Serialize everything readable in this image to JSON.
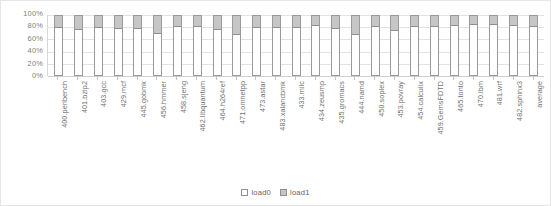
{
  "chart_data": {
    "type": "bar",
    "subtype": "stacked-percentage",
    "title": "",
    "xlabel": "",
    "ylabel": "",
    "ylim": [
      0,
      100
    ],
    "yticks": [
      0,
      20,
      40,
      60,
      80,
      100
    ],
    "ytick_labels": [
      "0%",
      "20%",
      "40%",
      "60%",
      "80%",
      "100%"
    ],
    "grid": true,
    "legend_position": "bottom",
    "categories": [
      "400.perlbench",
      "401.bzip2",
      "403.gcc",
      "429.mcf",
      "445.gobmk",
      "456.hmmer",
      "458.sjeng",
      "462.libquantum",
      "464.h264ref",
      "471.omnetpp",
      "473.astar",
      "483.xalancbmk",
      "433.milc",
      "434.zeusmp",
      "435.gromacs",
      "444.namd",
      "450.soplex",
      "453.povray",
      "454.calculix",
      "459.GemsFDTD",
      "465.tonto",
      "470.lbm",
      "481.wrf",
      "482.sphinx3",
      "average"
    ],
    "series": [
      {
        "name": "load0",
        "color": "#ffffff",
        "values": [
          80,
          76,
          79,
          78,
          78,
          70,
          81,
          81,
          76,
          68,
          79,
          79,
          79,
          83,
          78,
          67,
          82,
          75,
          81,
          81,
          83,
          85,
          84,
          83,
          82
        ]
      },
      {
        "name": "load1",
        "color": "#c6c6c6",
        "values": [
          20,
          24,
          21,
          22,
          22,
          30,
          19,
          19,
          24,
          32,
          21,
          21,
          21,
          17,
          22,
          33,
          18,
          25,
          19,
          19,
          17,
          15,
          16,
          17,
          18
        ]
      }
    ]
  },
  "legend": {
    "items": [
      {
        "label": "load0",
        "swatch": "load0"
      },
      {
        "label": "load1",
        "swatch": "load1"
      }
    ]
  }
}
